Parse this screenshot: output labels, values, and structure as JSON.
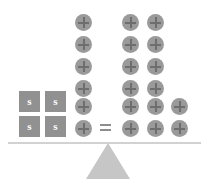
{
  "diagram": {
    "equals_symbol": "=",
    "colors": {
      "tile_fill": "#919191",
      "tile_label": "#ffffff",
      "chip_fill": "#9a9a9a",
      "chip_plus": "#6e6e6e",
      "beam": "#d2d2d2",
      "fulcrum": "#c6c6c6",
      "background": "#ffffff"
    },
    "left_pan": {
      "tile_label": "s",
      "tile_count": 4,
      "tiles": [
        {
          "label": "s",
          "x": 19,
          "y": 91
        },
        {
          "label": "s",
          "x": 45,
          "y": 91
        },
        {
          "label": "s",
          "x": 19,
          "y": 116
        },
        {
          "label": "s",
          "x": 45,
          "y": 116
        }
      ],
      "chip_count": 6,
      "chips": [
        {
          "x": 75,
          "y": 14
        },
        {
          "x": 75,
          "y": 36
        },
        {
          "x": 75,
          "y": 58
        },
        {
          "x": 75,
          "y": 80
        },
        {
          "x": 75,
          "y": 98
        },
        {
          "x": 75,
          "y": 120
        }
      ]
    },
    "equals": {
      "x": 100,
      "y": 124
    },
    "right_pan": {
      "chip_count": 14,
      "chips": [
        {
          "x": 122,
          "y": 14
        },
        {
          "x": 147,
          "y": 14
        },
        {
          "x": 122,
          "y": 36
        },
        {
          "x": 147,
          "y": 36
        },
        {
          "x": 122,
          "y": 58
        },
        {
          "x": 147,
          "y": 58
        },
        {
          "x": 122,
          "y": 80
        },
        {
          "x": 147,
          "y": 80
        },
        {
          "x": 122,
          "y": 98
        },
        {
          "x": 147,
          "y": 98
        },
        {
          "x": 171,
          "y": 98
        },
        {
          "x": 122,
          "y": 120
        },
        {
          "x": 147,
          "y": 120
        },
        {
          "x": 171,
          "y": 120
        }
      ]
    },
    "beam": {
      "x": 8,
      "y": 142,
      "width": 193,
      "height": 2
    },
    "fulcrum": {
      "x": 86,
      "y": 143,
      "width": 44,
      "height": 36
    }
  }
}
